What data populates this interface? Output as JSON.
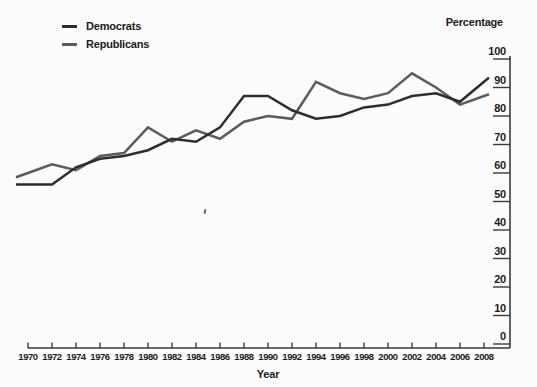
{
  "figure": {
    "legend": {
      "items": [
        {
          "label": "Democrats"
        },
        {
          "label": "Republicans"
        }
      ]
    },
    "y_axis_title": "Percentage",
    "x_axis_title": "Year"
  },
  "chart_data": {
    "type": "line",
    "title": "",
    "xlabel": "Year",
    "ylabel": "Percentage",
    "x": [
      1970,
      1972,
      1974,
      1976,
      1978,
      1980,
      1982,
      1984,
      1986,
      1988,
      1990,
      1992,
      1994,
      1996,
      1998,
      2000,
      2002,
      2004,
      2006,
      2008
    ],
    "series": [
      {
        "name": "Democrats",
        "color": "#2d2d2f",
        "values": [
          56,
          56,
          62,
          65,
          66,
          68,
          72,
          71,
          76,
          87,
          87,
          82,
          79,
          80,
          83,
          84,
          87,
          88,
          85,
          92
        ]
      },
      {
        "name": "Republicans",
        "color": "#5c5c5f",
        "values": [
          60,
          63,
          61,
          66,
          67,
          76,
          71,
          75,
          72,
          78,
          80,
          79,
          92,
          88,
          86,
          88,
          95,
          90,
          84,
          87
        ]
      }
    ],
    "ylim": [
      0,
      100
    ],
    "y_ticks": [
      0,
      10,
      20,
      30,
      40,
      50,
      60,
      70,
      80,
      90,
      100
    ],
    "x_tick_labels": [
      "1970",
      "1972",
      "1974",
      "1976",
      "1978",
      "1980",
      "1982",
      "1984",
      "1986",
      "1988",
      "1990",
      "1992",
      "1994",
      "1996",
      "1998",
      "2000",
      "2002",
      "2004",
      "2006",
      "2008"
    ],
    "grid": false,
    "legend_position": "top-left",
    "y_axis_side": "right",
    "axis_color": "#3a3a3a"
  }
}
